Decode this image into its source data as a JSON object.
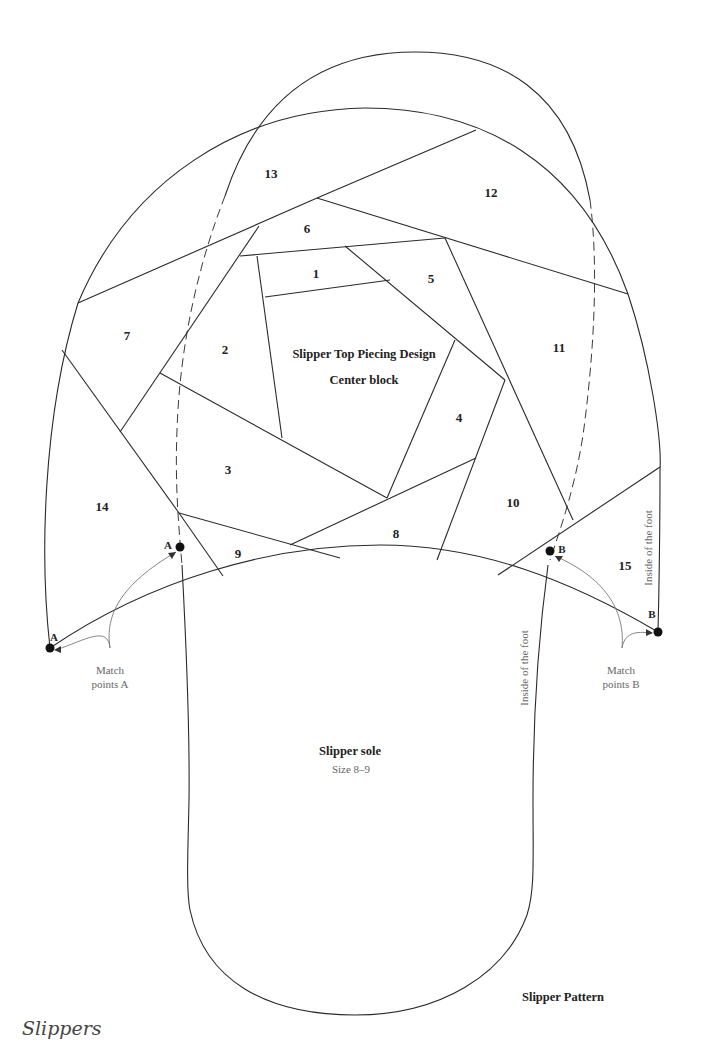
{
  "diagram": {
    "title": "Slipper Top Piecing Design",
    "subtitle": "Center block",
    "pieces": [
      {
        "id": "1",
        "x": 316,
        "y": 274
      },
      {
        "id": "2",
        "x": 225,
        "y": 350
      },
      {
        "id": "3",
        "x": 228,
        "y": 470
      },
      {
        "id": "4",
        "x": 459,
        "y": 418
      },
      {
        "id": "5",
        "x": 431,
        "y": 279
      },
      {
        "id": "6",
        "x": 307,
        "y": 229
      },
      {
        "id": "7",
        "x": 127,
        "y": 336
      },
      {
        "id": "8",
        "x": 396,
        "y": 534
      },
      {
        "id": "9",
        "x": 238,
        "y": 554
      },
      {
        "id": "10",
        "x": 513,
        "y": 503
      },
      {
        "id": "11",
        "x": 559,
        "y": 348
      },
      {
        "id": "12",
        "x": 491,
        "y": 193
      },
      {
        "id": "13",
        "x": 271,
        "y": 174
      },
      {
        "id": "14",
        "x": 102,
        "y": 507
      },
      {
        "id": "15",
        "x": 625,
        "y": 566
      }
    ],
    "match_points": {
      "a_label": "A",
      "b_label": "B",
      "a_note_line1": "Match",
      "a_note_line2": "points A",
      "b_note_line1": "Match",
      "b_note_line2": "points B"
    },
    "side_labels": {
      "top_inside": "Inside of the foot",
      "sole_inside": "Inside of the foot"
    },
    "sole": {
      "title": "Slipper sole",
      "size": "Size 8–9"
    },
    "pattern_caption": "Slipper Pattern",
    "page_header": "Slippers"
  }
}
